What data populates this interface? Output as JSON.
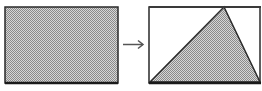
{
  "diagram": {
    "left_shape": {
      "type": "rectangle",
      "fill": "dotted-gray",
      "border": "#2a2a2a"
    },
    "arrow": {
      "direction": "right",
      "color": "#555555"
    },
    "right_shape": {
      "type": "rectangle-with-inscribed-triangle",
      "rect_fill": "#ffffff",
      "triangle_fill": "dotted-gray",
      "border": "#2a2a2a"
    },
    "colors": {
      "stroke": "#2a2a2a",
      "shade": "#b8b8b8",
      "arrow": "#555555",
      "background": "#ffffff"
    }
  }
}
